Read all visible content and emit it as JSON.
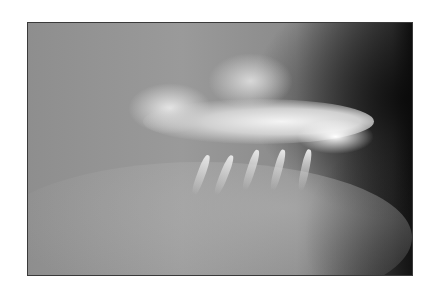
{
  "image": {
    "description": "Lateral dental radiograph showing upper and lower teeth in occlusion",
    "frame_border_color": "#3a3a3a",
    "background_color": "#ffffff"
  }
}
